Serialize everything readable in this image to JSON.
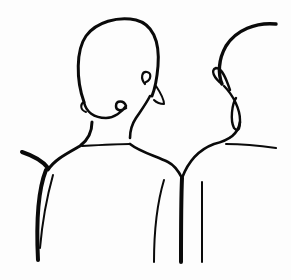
{
  "illustration": {
    "description": "Line drawing of two figures seen from behind, heads and shoulders",
    "figures": [
      {
        "name": "left-figure",
        "parts": [
          "head",
          "ear-curl",
          "neck",
          "shoulders",
          "back-lines"
        ]
      },
      {
        "name": "right-figure",
        "parts": [
          "head",
          "ear",
          "neck",
          "shoulders",
          "back-lines"
        ]
      }
    ],
    "colors": {
      "ink": "#0a0a0a",
      "paper": "#fdfdfd"
    }
  }
}
